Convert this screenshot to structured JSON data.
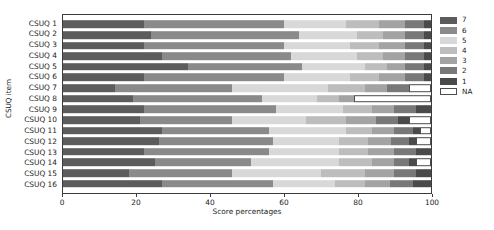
{
  "chart_data": {
    "type": "bar",
    "subtype": "stacked-horizontal-likert",
    "title": "",
    "xlabel": "Score percentages",
    "ylabel": "CSUQ item",
    "xlim": [
      0,
      100
    ],
    "grid": false,
    "legend_position": "right",
    "legend_title": "",
    "categories": [
      "CSUQ 1",
      "CSUQ 2",
      "CSUQ 3",
      "CSUQ 4",
      "CSUQ 5",
      "CSUQ 6",
      "CSUQ 7",
      "CSUQ 8",
      "CSUQ 9",
      "CSUQ 10",
      "CSUQ 11",
      "CSUQ 12",
      "CSUQ 13",
      "CSUQ 14",
      "CSUQ 15",
      "CSUQ 16"
    ],
    "legend_entries": [
      {
        "label": "7",
        "color": "#5c5c5c"
      },
      {
        "label": "6",
        "color": "#8a8a8a"
      },
      {
        "label": "5",
        "color": "#d8d8d8"
      },
      {
        "label": "4",
        "color": "#bdbdbd"
      },
      {
        "label": "3",
        "color": "#a3a3a3"
      },
      {
        "label": "2",
        "color": "#787878"
      },
      {
        "label": "1",
        "color": "#4a4a4a"
      },
      {
        "label": "NA",
        "color": "#ffffff"
      }
    ],
    "stack_order": [
      "7",
      "6",
      "5",
      "4",
      "3",
      "2",
      "1",
      "NA"
    ],
    "xticks": [
      0,
      20,
      40,
      60,
      80,
      100
    ],
    "series": [
      {
        "name": "7",
        "values": [
          22,
          24,
          22,
          27,
          34,
          22,
          14,
          19,
          22,
          21,
          27,
          26,
          22,
          25,
          18,
          27
        ]
      },
      {
        "name": "6",
        "values": [
          38,
          40,
          38,
          35,
          31,
          38,
          32,
          35,
          36,
          25,
          29,
          31,
          34,
          26,
          28,
          30
        ]
      },
      {
        "name": "5",
        "values": [
          17,
          16,
          18,
          18,
          17,
          18,
          26,
          15,
          18,
          20,
          21,
          18,
          19,
          24,
          24,
          17
        ]
      },
      {
        "name": "4",
        "values": [
          9,
          7,
          8,
          7,
          6,
          8,
          10,
          6,
          8,
          11,
          7,
          8,
          8,
          9,
          12,
          8
        ]
      },
      {
        "name": "3",
        "values": [
          7,
          6,
          7,
          6,
          5,
          7,
          6,
          4,
          6,
          8,
          6,
          6,
          7,
          6,
          8,
          7
        ]
      },
      {
        "name": "2",
        "values": [
          5,
          5,
          5,
          5,
          5,
          5,
          6,
          0,
          6,
          6,
          5,
          5,
          6,
          4,
          6,
          6
        ]
      },
      {
        "name": "1",
        "values": [
          2,
          2,
          2,
          2,
          2,
          2,
          0,
          0,
          4,
          3,
          2,
          2,
          4,
          2,
          4,
          5
        ]
      },
      {
        "name": "NA",
        "values": [
          0,
          0,
          0,
          0,
          0,
          0,
          6,
          21,
          0,
          6,
          3,
          4,
          0,
          4,
          0,
          0
        ]
      }
    ]
  }
}
